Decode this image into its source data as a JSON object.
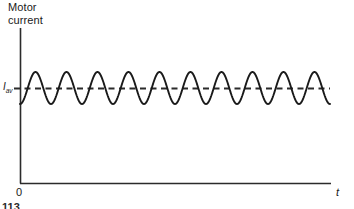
{
  "figure": {
    "y_axis_title": "Motor\ncurrent",
    "y_tick_symbol": "I",
    "y_tick_subscript": "av",
    "origin_label": "0",
    "x_axis_label": "t",
    "page_fragment": "113",
    "colors": {
      "line": "#1a1a1a",
      "axis": "#2b2b2b",
      "background": "#ffffff",
      "dashed_reference": "#2b2b2b"
    }
  },
  "chart_data": {
    "type": "line",
    "title": "Motor current",
    "xlabel": "t",
    "ylabel": "Motor current",
    "grid": false,
    "legend": false,
    "axis_origin_px": {
      "x": 20,
      "y": 183
    },
    "axis_extent_px": {
      "x_end": 330,
      "y_top": 28
    },
    "series": [
      {
        "name": "motor current ripple",
        "style": "solid",
        "description": "Sinusoidal ripple superimposed on the average motor current",
        "cycles": 10,
        "amplitude": 16,
        "baseline_px": 88,
        "x_start_px": 20,
        "x_end_px": 330,
        "start_phase": "trough"
      },
      {
        "name": "average motor current",
        "style": "dashed",
        "description": "Horizontal dashed reference line at I_av",
        "value_px": 88,
        "x_start_px": 20,
        "x_end_px": 330,
        "label": "I_av"
      }
    ],
    "annotations": [
      {
        "text": "I",
        "subscript": "av",
        "x_px": 6,
        "y_px": 88
      },
      {
        "text": "0",
        "x_px": 18,
        "y_px": 192
      },
      {
        "text": "t",
        "x_px": 338,
        "y_px": 192
      }
    ]
  }
}
